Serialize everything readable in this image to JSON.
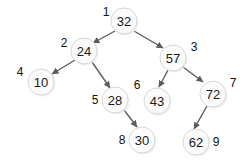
{
  "diagram": {
    "type": "binary-heap-tree",
    "background_color": "#ffffff",
    "node_fill": "#fbfbfb",
    "node_stroke": "#d8d8d8",
    "edge_color": "#5c5c5c",
    "text_color": "#1a1a1a",
    "nodes": [
      {
        "id": "n1",
        "index": "1",
        "value": "32",
        "cx": 124,
        "cy": 21,
        "r": 13,
        "index_x": 106,
        "index_y": 12
      },
      {
        "id": "n2",
        "index": "2",
        "value": "24",
        "cx": 84,
        "cy": 51,
        "r": 13,
        "index_x": 64,
        "index_y": 43
      },
      {
        "id": "n3",
        "index": "3",
        "value": "57",
        "cx": 173,
        "cy": 58,
        "r": 13,
        "index_x": 194,
        "index_y": 47
      },
      {
        "id": "n4",
        "index": "4",
        "value": "10",
        "cx": 41,
        "cy": 82,
        "r": 13,
        "index_x": 20,
        "index_y": 72
      },
      {
        "id": "n5",
        "index": "5",
        "value": "28",
        "cx": 115,
        "cy": 100,
        "r": 13,
        "index_x": 95,
        "index_y": 100
      },
      {
        "id": "n6",
        "index": "6",
        "value": "43",
        "cx": 157,
        "cy": 101,
        "r": 13,
        "index_x": 137,
        "index_y": 85
      },
      {
        "id": "n7",
        "index": "7",
        "value": "72",
        "cx": 213,
        "cy": 94,
        "r": 13,
        "index_x": 233,
        "index_y": 83
      },
      {
        "id": "n8",
        "index": "8",
        "value": "30",
        "cx": 142,
        "cy": 140,
        "r": 13,
        "index_x": 122,
        "index_y": 140
      },
      {
        "id": "n9",
        "index": "9",
        "value": "62",
        "cx": 196,
        "cy": 142,
        "r": 13,
        "index_x": 216,
        "index_y": 142
      }
    ],
    "edges": [
      {
        "id": "e1",
        "from": "n1",
        "to": "n2",
        "x1": 115,
        "y1": 31,
        "x2": 93,
        "y2": 43
      },
      {
        "id": "e2",
        "from": "n1",
        "to": "n3",
        "x1": 134,
        "y1": 31,
        "x2": 163,
        "y2": 48
      },
      {
        "id": "e3",
        "from": "n2",
        "to": "n4",
        "x1": 75,
        "y1": 60,
        "x2": 52,
        "y2": 74
      },
      {
        "id": "e4",
        "from": "n2",
        "to": "n5",
        "x1": 92,
        "y1": 62,
        "x2": 110,
        "y2": 88
      },
      {
        "id": "e5",
        "from": "n3",
        "to": "n6",
        "x1": 168,
        "y1": 70,
        "x2": 159,
        "y2": 87
      },
      {
        "id": "e6",
        "from": "n3",
        "to": "n7",
        "x1": 183,
        "y1": 67,
        "x2": 203,
        "y2": 82
      },
      {
        "id": "e7",
        "from": "n5",
        "to": "n8",
        "x1": 124,
        "y1": 110,
        "x2": 137,
        "y2": 127
      },
      {
        "id": "e8",
        "from": "n7",
        "to": "n9",
        "x1": 207,
        "y1": 106,
        "x2": 194,
        "y2": 129
      }
    ]
  }
}
